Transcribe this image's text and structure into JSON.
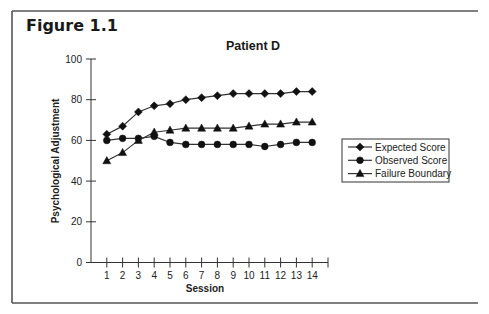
{
  "figure": {
    "label": "Figure 1.1"
  },
  "chart_data": {
    "type": "line",
    "title": "Patient D",
    "xlabel": "Session",
    "ylabel": "Psychological Adjustment",
    "x": [
      1,
      2,
      3,
      4,
      5,
      6,
      7,
      8,
      9,
      10,
      11,
      12,
      13,
      14
    ],
    "xlim": [
      0,
      15
    ],
    "ylim": [
      0,
      100
    ],
    "yticks": [
      0,
      20,
      40,
      60,
      80,
      100
    ],
    "xticks": [
      1,
      2,
      3,
      4,
      5,
      6,
      7,
      8,
      9,
      10,
      11,
      12,
      13,
      14
    ],
    "grid": false,
    "legend_position": "right",
    "series": [
      {
        "name": "Expected Score",
        "marker": "diamond",
        "values": [
          63,
          67,
          74,
          77,
          78,
          80,
          81,
          82,
          83,
          83,
          83,
          83,
          84,
          84
        ]
      },
      {
        "name": "Observed Score",
        "marker": "circle",
        "values": [
          60,
          61,
          61,
          62,
          59,
          58,
          58,
          58,
          58,
          58,
          57,
          58,
          59,
          59
        ]
      },
      {
        "name": "Failure Boundary",
        "marker": "triangle",
        "values": [
          50,
          54,
          60,
          64,
          65,
          66,
          66,
          66,
          66,
          67,
          68,
          68,
          69,
          69
        ]
      }
    ]
  }
}
